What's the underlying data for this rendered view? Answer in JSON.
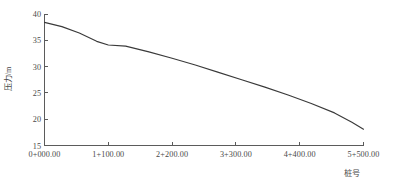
{
  "chart_data": {
    "type": "line",
    "title": "",
    "xlabel": "桩号",
    "ylabel": "压力/m",
    "grid": false,
    "legend": null,
    "xlim": [
      0,
      5500
    ],
    "ylim": [
      15,
      40
    ],
    "x_tick_labels": [
      "0+000.00",
      "1+100.00",
      "2+200.00",
      "3+300.00",
      "4+400.00",
      "5+500.00"
    ],
    "x_tick_values": [
      0,
      1100,
      2200,
      3300,
      4400,
      5500
    ],
    "y_tick_labels": [
      "15",
      "20",
      "25",
      "30",
      "35",
      "40"
    ],
    "y_tick_values": [
      15,
      20,
      25,
      30,
      35,
      40
    ],
    "series": [
      {
        "name": "压力",
        "x": [
          0,
          300,
          600,
          900,
          1100,
          1400,
          1800,
          2200,
          2600,
          3000,
          3400,
          3800,
          4200,
          4600,
          5000,
          5300,
          5500
        ],
        "values": [
          38.4,
          37.6,
          36.4,
          34.8,
          34.1,
          33.9,
          32.8,
          31.6,
          30.3,
          28.9,
          27.5,
          26.1,
          24.6,
          23.0,
          21.2,
          19.4,
          18.1
        ]
      }
    ]
  },
  "axis": {
    "y_title": "压力/m",
    "x_title": "桩号"
  }
}
